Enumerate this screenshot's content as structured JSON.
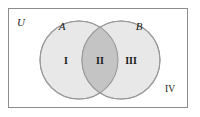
{
  "figure": {
    "type": "venn-diagram-two-sets",
    "canvas": {
      "width": 200,
      "height": 117
    },
    "background_color": "#ffffff"
  },
  "universal_set": {
    "label": "U",
    "border_color": "#8c8c8c",
    "fill_color": "#ffffff",
    "rect": {
      "x": 8,
      "y": 8,
      "width": 180,
      "height": 100
    }
  },
  "sets": [
    {
      "name": "set-a",
      "label": "A",
      "fill_color": "#e8e8e8",
      "stroke_color": "#9a9a9a",
      "cx": 79,
      "cy": 60,
      "r": 39,
      "label_x": 62,
      "label_y": 30
    },
    {
      "name": "set-b",
      "label": "B",
      "fill_color": "#e8e8e8",
      "stroke_color": "#9a9a9a",
      "cx": 121,
      "cy": 60,
      "r": 39,
      "label_x": 139,
      "label_y": 30
    }
  ],
  "intersection": {
    "name": "a-intersect-b",
    "fill_color": "#c4c4c4",
    "stroke_color": "#9a9a9a"
  },
  "regions": [
    {
      "id": "region-i",
      "label": "I",
      "description": "A only",
      "x": 66,
      "y": 64,
      "inside": true
    },
    {
      "id": "region-ii",
      "label": "II",
      "description": "A and B",
      "x": 100,
      "y": 64,
      "inside": true
    },
    {
      "id": "region-iii",
      "label": "III",
      "description": "B only",
      "x": 131,
      "y": 64,
      "inside": true
    },
    {
      "id": "region-iv",
      "label": "IV",
      "description": "outside A and B",
      "x": 170,
      "y": 92,
      "inside": false
    }
  ]
}
